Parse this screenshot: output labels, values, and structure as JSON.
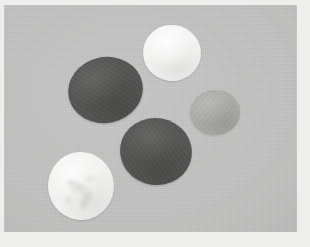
{
  "scene": {
    "title": "Colored discs on gray background",
    "kind": "photograph",
    "width": 310,
    "height": 247,
    "border_color": "#eeeeec",
    "background_color": "#c2c3c1",
    "object_count_label": "5"
  },
  "objects": [
    {
      "id": "disc-dark-left",
      "label": "dark gray disc (upper left)",
      "shade": "dark",
      "color": "#565654",
      "x": 68,
      "y": 57,
      "w": 75,
      "h": 66,
      "rotation": "-12deg"
    },
    {
      "id": "disc-white-top",
      "label": "white disc (top)",
      "shade": "white",
      "color": "#f3f3f1",
      "x": 143,
      "y": 25,
      "w": 58,
      "h": 56,
      "rotation": "8deg"
    },
    {
      "id": "disc-gray-right",
      "label": "medium gray disc (right)",
      "shade": "gray",
      "color": "#adaeaa",
      "x": 190,
      "y": 90,
      "w": 50,
      "h": 45,
      "rotation": "-6deg"
    },
    {
      "id": "disc-dark-center",
      "label": "dark gray disc (center)",
      "shade": "dark",
      "color": "#565654",
      "x": 120,
      "y": 118,
      "w": 72,
      "h": 67,
      "rotation": "10deg"
    },
    {
      "id": "disc-white-bottom",
      "label": "white crumpled disc (lower left)",
      "shade": "white-mottled",
      "color": "#f1f1ef",
      "x": 48,
      "y": 152,
      "w": 66,
      "h": 68,
      "rotation": "-4deg"
    }
  ]
}
